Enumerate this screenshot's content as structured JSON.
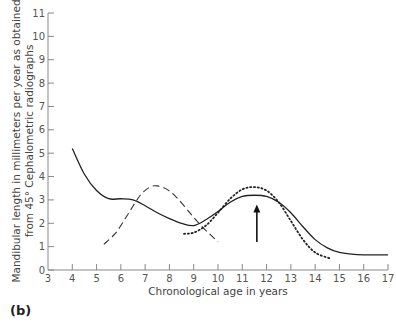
{
  "panel_label": "(b)",
  "chart_data": {
    "type": "line",
    "title": "",
    "xlabel": "Chronological age in years",
    "ylabel": "Mandibular length in millimeters per year as obtained from 45° Cephalometric radiographs",
    "ylabel_lines": [
      "Mandibular length in millimeters per year as obtained",
      "from 45° Cephalometric radiographs"
    ],
    "xlim": [
      3,
      17
    ],
    "ylim": [
      0,
      11
    ],
    "x_ticks": [
      3,
      4,
      5,
      6,
      7,
      8,
      9,
      10,
      11,
      12,
      13,
      14,
      15,
      16,
      17
    ],
    "y_ticks": [
      0,
      1,
      2,
      3,
      4,
      5,
      6,
      7,
      8,
      9,
      10,
      11
    ],
    "grid": false,
    "legend": null,
    "series": [
      {
        "name": "solid",
        "style": "solid",
        "x": [
          4.0,
          4.5,
          5.0,
          5.5,
          6.0,
          6.5,
          7.0,
          7.5,
          8.0,
          8.5,
          9.0,
          9.5,
          10.0,
          10.5,
          11.0,
          11.5,
          12.0,
          12.5,
          13.0,
          13.5,
          14.0,
          14.5,
          15.0,
          15.5,
          16.0,
          16.5,
          17.0
        ],
        "values": [
          5.2,
          4.1,
          3.4,
          3.05,
          3.05,
          3.0,
          2.75,
          2.45,
          2.2,
          2.0,
          1.9,
          2.15,
          2.5,
          2.9,
          3.15,
          3.2,
          3.15,
          2.9,
          2.45,
          1.85,
          1.3,
          0.95,
          0.75,
          0.68,
          0.65,
          0.65,
          0.65
        ]
      },
      {
        "name": "dashed",
        "style": "dashed",
        "x": [
          5.3,
          5.8,
          6.3,
          6.8,
          7.2,
          7.5,
          7.9,
          8.3,
          8.8,
          9.3,
          9.7,
          10.0
        ],
        "values": [
          1.1,
          1.6,
          2.4,
          3.2,
          3.55,
          3.6,
          3.45,
          3.1,
          2.5,
          1.9,
          1.5,
          1.2
        ]
      },
      {
        "name": "dotted",
        "style": "dotted",
        "x": [
          8.6,
          9.0,
          9.5,
          10.0,
          10.5,
          11.0,
          11.5,
          12.0,
          12.5,
          13.0,
          13.5,
          14.0,
          14.6
        ],
        "values": [
          1.55,
          1.6,
          1.9,
          2.45,
          3.05,
          3.45,
          3.55,
          3.4,
          2.9,
          2.1,
          1.3,
          0.75,
          0.5
        ]
      }
    ],
    "annotations": [
      {
        "type": "arrow",
        "x": 11.6,
        "y_start": 1.2,
        "y_end": 2.8,
        "direction": "up"
      }
    ]
  }
}
